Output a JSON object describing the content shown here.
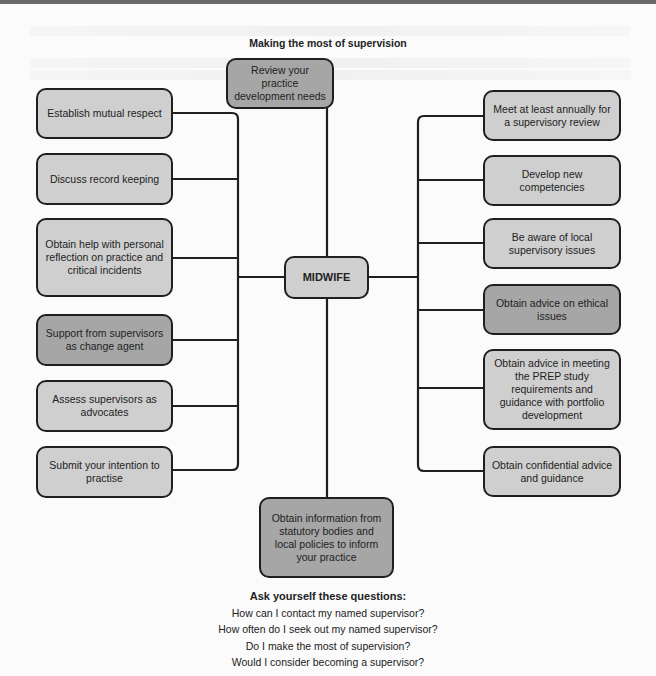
{
  "diagram": {
    "title": "Making the most of supervision",
    "center_node": "MIDWIFE",
    "top_node": {
      "text": "Review your practice development needs",
      "shade": "dark"
    },
    "bottom_node": {
      "text": "Obtain information from statutory bodies and local policies to inform your practice",
      "shade": "dark"
    },
    "left_nodes": [
      {
        "text": "Establish mutual respect",
        "shade": "light"
      },
      {
        "text": "Discuss record keeping",
        "shade": "light"
      },
      {
        "text": "Obtain help with personal reflection on practice and critical incidents",
        "shade": "light"
      },
      {
        "text": "Support from supervisors as change agent",
        "shade": "dark"
      },
      {
        "text": "Assess supervisors as advocates",
        "shade": "light"
      },
      {
        "text": "Submit your intention to practise",
        "shade": "light"
      }
    ],
    "right_nodes": [
      {
        "text": "Meet at least annually for a supervisory review",
        "shade": "light"
      },
      {
        "text": "Develop new competencies",
        "shade": "light"
      },
      {
        "text": "Be aware of local supervisory issues",
        "shade": "light"
      },
      {
        "text": "Obtain advice on ethical issues",
        "shade": "dark"
      },
      {
        "text": "Obtain advice in meeting the PREP study requirements and guidance with portfolio development",
        "shade": "light"
      },
      {
        "text": "Obtain confidential advice and guidance",
        "shade": "light"
      }
    ],
    "colors": {
      "light_fill": "#cfcfcf",
      "dark_fill": "#a6a6a6",
      "stroke": "#1f1f1f"
    }
  },
  "questions": {
    "heading": "Ask yourself these questions:",
    "items": [
      "How can I contact my named supervisor?",
      "How often do I seek out my named supervisor?",
      "Do I make the most of supervision?",
      "Would I consider becoming a supervisor?"
    ]
  }
}
